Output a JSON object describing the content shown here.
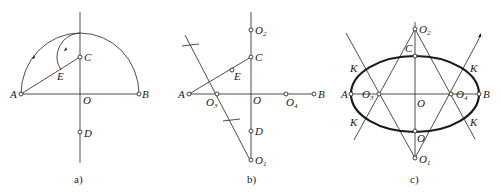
{
  "figure": {
    "panels": [
      {
        "id": "a",
        "caption": "a)",
        "labels": {
          "A": "A",
          "B": "B",
          "C": "C",
          "D": "D",
          "E": "E",
          "O": "O"
        }
      },
      {
        "id": "b",
        "caption": "b)",
        "labels": {
          "A": "A",
          "B": "B",
          "C": "C",
          "D": "D",
          "E": "E",
          "O": "O",
          "O1": "O",
          "O1_sub": "1",
          "O2": "O",
          "O2_sub": "2",
          "O3": "O",
          "O3_sub": "3",
          "O4": "O",
          "O4_sub": "4"
        }
      },
      {
        "id": "c",
        "caption": "c)",
        "labels": {
          "A": "A",
          "B": "B",
          "C": "C",
          "O": "O",
          "O_bottom": "O",
          "O1": "O",
          "O1_sub": "1",
          "O2": "O",
          "O2_sub": "2",
          "O3": "O",
          "O3_sub": "3",
          "O4": "O",
          "O4_sub": "4",
          "K1": "K",
          "K2": "K",
          "K3": "K",
          "K4": "K"
        }
      }
    ]
  }
}
